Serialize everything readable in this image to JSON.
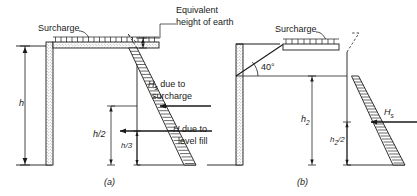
{
  "figure": {
    "background_color": "#ffffff",
    "ink_color": "#1a1a1a",
    "width": 417,
    "height": 196
  },
  "panel_a": {
    "tag": "(a)",
    "surcharge_label": "Surcharge",
    "wall_height_label": "h",
    "equivalent_height_label_line1": "Equivalent",
    "equivalent_height_label_line2": "height of earth",
    "force_surcharge_symbol": "H",
    "force_surcharge_subscript": "s",
    "force_surcharge_text_line1": "due to",
    "force_surcharge_text_line2": "surcharge",
    "force_fill_symbol": "H",
    "force_fill_text_line1": "due to",
    "force_fill_text_line2": "level fill",
    "dim_half_label": "h/2",
    "dim_third_label": "h/3"
  },
  "panel_b": {
    "tag": "(b)",
    "surcharge_label": "Surcharge",
    "slope_angle_label": "40°",
    "wall_height_symbol": "h",
    "wall_height_subscript": "2",
    "dim_half_symbol": "h",
    "dim_half_subscript": "2",
    "dim_half_suffix": "/2",
    "force_surcharge_symbol": "H",
    "force_surcharge_subscript": "s"
  }
}
